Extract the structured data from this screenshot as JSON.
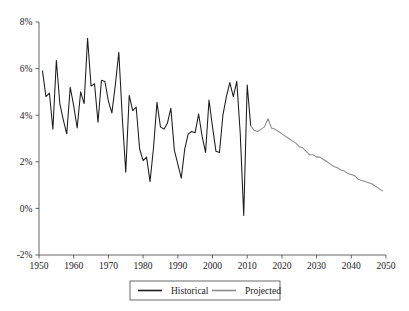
{
  "chart_data": {
    "type": "line",
    "title": "",
    "subtitle": "",
    "xlabel": "",
    "ylabel": "",
    "xlim": [
      1950,
      2050
    ],
    "ylim": [
      -0.02,
      0.08
    ],
    "grid": false,
    "legend_position": "bottom-center",
    "x_ticks": [
      1950,
      1960,
      1970,
      1980,
      1990,
      2000,
      2010,
      2020,
      2030,
      2040,
      2050
    ],
    "x_tick_labels": [
      "1950",
      "1960",
      "1970",
      "1980",
      "1990",
      "2000",
      "2010",
      "2020",
      "2030",
      "2040",
      "2050"
    ],
    "y_ticks": [
      -0.02,
      0,
      0.02,
      0.04,
      0.06,
      0.08
    ],
    "y_tick_labels": [
      "-2%",
      "0%",
      "2%",
      "4%",
      "6%",
      "8%"
    ],
    "series": [
      {
        "name": "Historical",
        "color": "#1b1b1b",
        "x": [
          1951,
          1952,
          1953,
          1954,
          1955,
          1956,
          1957,
          1958,
          1959,
          1960,
          1961,
          1962,
          1963,
          1964,
          1965,
          1966,
          1967,
          1968,
          1969,
          1970,
          1971,
          1972,
          1973,
          1974,
          1975,
          1976,
          1977,
          1978,
          1979,
          1980,
          1981,
          1982,
          1983,
          1984,
          1985,
          1986,
          1987,
          1988,
          1989,
          1990,
          1991,
          1992,
          1993,
          1994,
          1995,
          1996,
          1997,
          1998,
          1999,
          2000,
          2001,
          2002,
          2003,
          2004,
          2005,
          2006,
          2007,
          2008,
          2009,
          2010,
          2011
        ],
        "y": [
          5.9,
          4.8,
          4.95,
          3.4,
          6.35,
          4.5,
          3.8,
          3.2,
          5.2,
          4.4,
          3.45,
          5.0,
          4.5,
          7.3,
          5.25,
          5.35,
          3.7,
          5.5,
          5.45,
          4.6,
          4.1,
          5.3,
          6.7,
          3.9,
          1.55,
          4.85,
          4.2,
          4.35,
          2.55,
          2.05,
          2.2,
          1.15,
          2.6,
          4.55,
          3.5,
          3.4,
          3.65,
          4.3,
          2.5,
          1.9,
          1.3,
          2.55,
          3.2,
          3.3,
          3.25,
          4.05,
          3.1,
          2.4,
          4.65,
          3.5,
          2.45,
          2.4,
          4.0,
          4.8,
          5.4,
          4.8,
          5.45,
          3.2,
          -0.3,
          5.3,
          3.55
        ],
        "unit": "percent"
      },
      {
        "name": "Projected",
        "color": "#8a8a8a",
        "x": [
          2011,
          2012,
          2013,
          2014,
          2015,
          2016,
          2017,
          2018,
          2019,
          2020,
          2021,
          2022,
          2023,
          2024,
          2025,
          2026,
          2027,
          2028,
          2029,
          2030,
          2031,
          2032,
          2033,
          2034,
          2035,
          2036,
          2037,
          2038,
          2039,
          2040,
          2041,
          2042,
          2043,
          2044,
          2045,
          2046,
          2047,
          2048,
          2049
        ],
        "y": [
          3.55,
          3.35,
          3.3,
          3.4,
          3.5,
          3.85,
          3.45,
          3.4,
          3.3,
          3.2,
          3.1,
          3.0,
          2.9,
          2.8,
          2.65,
          2.6,
          2.45,
          2.3,
          2.3,
          2.2,
          2.2,
          2.1,
          2.0,
          1.9,
          1.8,
          1.75,
          1.65,
          1.6,
          1.5,
          1.45,
          1.4,
          1.25,
          1.2,
          1.15,
          1.1,
          1.05,
          0.95,
          0.85,
          0.75
        ],
        "unit": "percent"
      }
    ],
    "annotations": []
  },
  "legend": {
    "items": [
      {
        "label": "Historical",
        "color": "#1b1b1b"
      },
      {
        "label": "Projected",
        "color": "#8a8a8a"
      }
    ]
  }
}
